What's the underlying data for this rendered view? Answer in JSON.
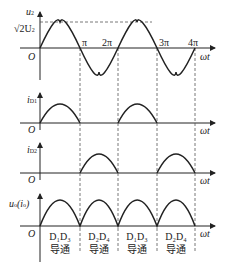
{
  "panels": [
    {
      "ylabel": "u",
      "ylabel_sub": "2",
      "amp_label": "√2U",
      "amp_sub": "2",
      "origin": "O",
      "xlabel": "ωt",
      "ticks": [
        "π",
        "2π",
        "3π",
        "4π"
      ],
      "waveform": "sine"
    },
    {
      "ylabel": "i",
      "ylabel_sub": "D1",
      "origin": "O",
      "xlabel": "ωt",
      "waveform": "half-wave positive (0-π, 2π-3π)"
    },
    {
      "ylabel": "i",
      "ylabel_sub": "D2",
      "origin": "O",
      "xlabel": "ωt",
      "waveform": "half-wave (π-2π, 3π-4π)"
    },
    {
      "ylabel": "u",
      "ylabel_sub": "o",
      "ylabel_extra": "(i",
      "ylabel_extra_sub": "o",
      "ylabel_close": ")",
      "origin": "O",
      "xlabel": "ωt",
      "waveform": "full-wave rectified"
    }
  ],
  "conduction": [
    {
      "diodes": "D₁D₃",
      "state": "导通"
    },
    {
      "diodes": "D₂D₄",
      "state": "导通"
    },
    {
      "diodes": "D₁D₃",
      "state": "导通"
    },
    {
      "diodes": "D₂D₄",
      "state": "导通"
    }
  ],
  "colors": {
    "line": "#222222",
    "dash": "#555555"
  }
}
